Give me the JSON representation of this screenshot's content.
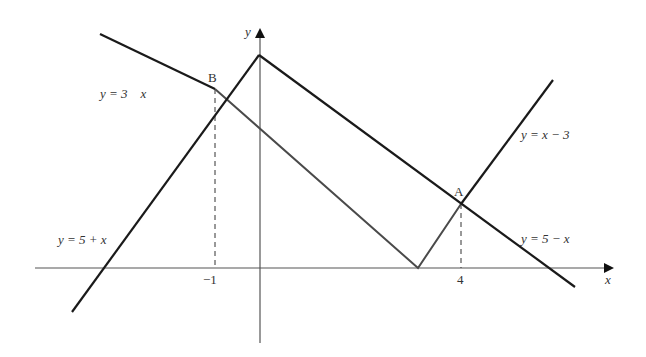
{
  "diagram": {
    "type": "coordinate-geometry-graph",
    "axes": {
      "x_label": "x",
      "y_label": "y",
      "x_ticks": [
        {
          "value": -1,
          "label": "−1"
        },
        {
          "value": 4,
          "label": "4"
        }
      ]
    },
    "lines": [
      {
        "id": "line-y-3-minus-x",
        "label": "y = 3    x",
        "equation": "y = 3 − x"
      },
      {
        "id": "line-y-5-plus-x",
        "label": "y = 5 + x",
        "equation": "y = 5 + x"
      },
      {
        "id": "line-y-x-minus-3",
        "label": "y = x − 3",
        "equation": "y = x − 3"
      },
      {
        "id": "line-y-5-minus-x",
        "label": "y = 5 − x",
        "equation": "y = 5 − x"
      }
    ],
    "points": [
      {
        "name": "B",
        "label": "B",
        "x": -1,
        "y": 4
      },
      {
        "name": "A",
        "label": "A",
        "x": 4,
        "y": 1
      }
    ],
    "colors": {
      "outer_lines": "#1a1a1a",
      "inner_path": "#4a4a4a",
      "axes": "#555555",
      "text": "#333333"
    }
  }
}
